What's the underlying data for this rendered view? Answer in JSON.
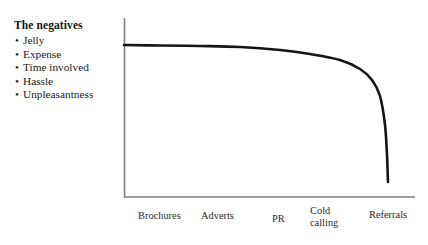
{
  "annotation": {
    "title": "The negatives",
    "bullet_glyph": "•",
    "items": [
      "Jelly",
      "Expense",
      "Time involved",
      "Hassle",
      "Unpleasantness"
    ]
  },
  "colors": {
    "background": "#ffffff",
    "curve": "#141414",
    "axis": "#808080",
    "text": "#1a1a1a"
  },
  "chart_data": {
    "type": "line",
    "title": "",
    "xlabel": "",
    "ylabel": "",
    "grid": false,
    "legend_position": "left-annotation",
    "categories": [
      "Brochures",
      "Adverts",
      "PR",
      "Cold\ncalling",
      "Referrals"
    ],
    "tick_labels": {
      "brochures": "Brochures",
      "adverts": "Adverts",
      "pr": "PR",
      "cold_calling": "Cold\ncalling",
      "referrals": "Referrals"
    },
    "series": [
      {
        "name": "Effectiveness",
        "values": [
          100,
          98,
          94,
          78,
          8
        ],
        "points_px": [
          [
            124,
            45
          ],
          [
            160,
            45.5
          ],
          [
            200,
            46
          ],
          [
            240,
            47
          ],
          [
            280,
            50
          ],
          [
            310,
            54
          ],
          [
            340,
            60
          ],
          [
            360,
            69
          ],
          [
            372,
            80
          ],
          [
            380,
            96
          ],
          [
            385,
            125
          ],
          [
            387,
            155
          ],
          [
            388,
            182
          ]
        ]
      }
    ],
    "ylim": [
      0,
      105
    ],
    "axis_pixels": {
      "y_axis_x": 124,
      "y_axis_top": 18,
      "x_axis_y": 197,
      "x_axis_right": 415
    }
  }
}
